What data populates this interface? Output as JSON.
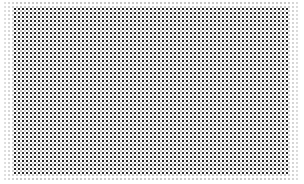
{
  "image": {
    "width": 304,
    "height": 184,
    "background_color": "#ffffff"
  },
  "pattern": {
    "type": "dot-grid",
    "dot_color": "#2a2a2a",
    "halo_dot_color": "#787878",
    "pitch_px": 4,
    "dot_size_px": 2,
    "grid_bounds": {
      "left": 14,
      "top": 8,
      "right": 290,
      "bottom": 176
    },
    "edge": "faded"
  }
}
